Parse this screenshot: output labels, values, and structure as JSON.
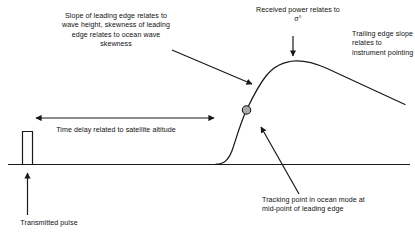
{
  "diagram": {
    "colors": {
      "ink": "#111111",
      "stroke": "#1a1a1a",
      "tracking_point_fill": "#a9a9a9",
      "background": "#ffffff"
    },
    "annotations": {
      "leading_edge": {
        "name": "leading-edge-annotation",
        "text": "Slope of leading edge relates to wave height, skewness of leading edge relates to ocean wave skewness",
        "lines": [
          "Slope of leading edge",
          "relates to wave height,",
          "skewness of leading",
          "edge relates to ocean",
          "wave skewness"
        ]
      },
      "received_power": {
        "name": "received-power-annotation",
        "text": "Received power relates to σ°",
        "lines": [
          "Received power",
          "relates to σ°"
        ]
      },
      "trailing_edge": {
        "name": "trailing-edge-annotation",
        "text": "Trailing edge slope relates to instrument pointing",
        "lines": [
          "Trailing edge",
          "slope relates",
          "to instrument",
          "pointing"
        ]
      },
      "time_delay": {
        "name": "time-delay-annotation",
        "text": "Time delay related to satellite altitude",
        "lines": [
          "Time delay related to",
          "satellite altitude"
        ]
      },
      "tracking_point": {
        "name": "tracking-point-annotation",
        "text": "Tracking point in ocean mode at mid-point of leading edge",
        "lines": [
          "Tracking point in ocean",
          "mode at mid-point of",
          "leading edge"
        ]
      },
      "transmitted_pulse": {
        "name": "transmitted-pulse-annotation",
        "text": "Transmitted pulse",
        "lines": [
          "Transmitted pulse"
        ]
      }
    },
    "elements": {
      "baseline": {
        "label": "time axis baseline"
      },
      "transmitted_pulse_bar": {
        "label": "transmitted pulse"
      },
      "return_waveform": {
        "label": "ocean return waveform"
      },
      "tracking_point_marker": {
        "label": "tracking point marker"
      },
      "time_delay_arrow": {
        "label": "time delay double arrow"
      },
      "leading_edge_pointer": {
        "label": "leading edge pointer arrow"
      },
      "received_power_pointer": {
        "label": "received power pointer arrow"
      },
      "tracking_point_pointer": {
        "label": "tracking point pointer arrow"
      },
      "transmitted_pulse_pointer": {
        "label": "transmitted pulse pointer arrow"
      }
    }
  }
}
